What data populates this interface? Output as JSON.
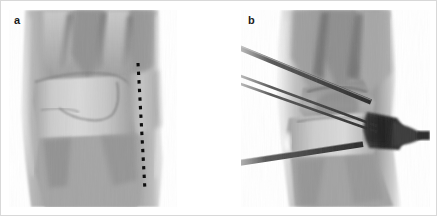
{
  "figure": {
    "type": "radiograph-pair",
    "background": "#ffffff",
    "border_color": "#d8d8d8",
    "width": 437,
    "height": 216
  },
  "panels": [
    {
      "id": "a",
      "label": "a",
      "modality": "radiograph",
      "view": "posteroanterior wrist / distal forearm",
      "colorspace": "grayscale",
      "tone": {
        "background": "#ffffff",
        "soft_tissue": "#9b9b9b",
        "bone_mid": "#b4b4b4",
        "bone_dense": "#d6d6d6",
        "joint_space_dark": "#6d6d6d",
        "marker": "#0d0d0d"
      },
      "annotations": [
        {
          "name": "dashed-reference-line",
          "style": "dashed",
          "color": "#0d0d0d",
          "orientation": "vertical",
          "x1_pct": 77,
          "y1_pct": 27,
          "x2_pct": 81,
          "y2_pct": 92
        }
      ],
      "features": [
        "distal radius",
        "distal ulna",
        "carpal row",
        "radiocarpal joint space",
        "fracture line"
      ]
    },
    {
      "id": "b",
      "label": "b",
      "modality": "radiograph",
      "view": "posteroanterior wrist with fixation hardware",
      "colorspace": "grayscale",
      "tone": {
        "background": "#ffffff",
        "soft_tissue": "#a2a2a2",
        "bone_mid": "#bcbcbc",
        "bone_dense": "#dcdcdc",
        "joint_space_dark": "#5f5f5f",
        "hardware": "#2e2e2e"
      },
      "hardware": [
        {
          "name": "k-wire-upper",
          "count": 1,
          "entry": "proximal-left",
          "angle_deg": 22
        },
        {
          "name": "k-wire-middle-pair",
          "count": 2,
          "entry": "mid-left",
          "angle_deg": 17
        },
        {
          "name": "k-wire-lower",
          "count": 1,
          "entry": "distal-left",
          "angle_deg": 12
        },
        {
          "name": "external-fixator-clamp",
          "count": 1,
          "position": "right-lateral",
          "radiopacity": "high"
        }
      ],
      "features": [
        "distal radius",
        "distal ulna",
        "carpal row",
        "percutaneous pinning",
        "external fixator pin"
      ]
    }
  ]
}
